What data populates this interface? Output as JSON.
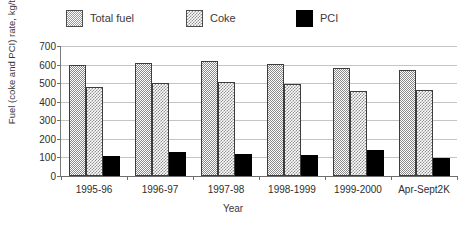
{
  "chart_data": {
    "type": "bar",
    "title": "",
    "xlabel": "Year",
    "ylabel": "Fuel (coke and PCI) rate, kg/thm",
    "ylim": [
      0,
      700
    ],
    "ytick_step": 100,
    "yticks": [
      0,
      100,
      200,
      300,
      400,
      500,
      600,
      700
    ],
    "grid": true,
    "legend_position": "top",
    "categories": [
      "1995-96",
      "1996-97",
      "1997-98",
      "1998-1999",
      "1999-2000",
      "Apr-Sept2K"
    ],
    "series": [
      {
        "name": "Total fuel",
        "pattern": "dotted-gray",
        "color": "#8a8a8a",
        "values": [
          600,
          608,
          618,
          602,
          583,
          572
        ]
      },
      {
        "name": "Coke",
        "pattern": "checkered-gray",
        "color": "#8f8f8f",
        "values": [
          478,
          500,
          505,
          498,
          460,
          465
        ]
      },
      {
        "name": "PCI",
        "pattern": "solid-black",
        "color": "#000000",
        "values": [
          110,
          128,
          120,
          115,
          138,
          98
        ]
      }
    ]
  },
  "legend": {
    "items": [
      {
        "label": "Total fuel",
        "swatch": "pat-dot"
      },
      {
        "label": "Coke",
        "swatch": "pat-check"
      },
      {
        "label": "PCI",
        "swatch": "pat-solid"
      }
    ]
  },
  "axes": {
    "y_title": "Fuel (coke and PCI) rate, kg/thm",
    "x_title": "Year"
  }
}
